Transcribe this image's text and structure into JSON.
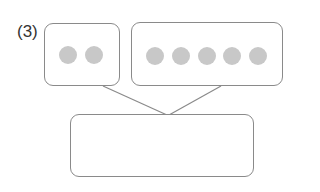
{
  "problem": {
    "label": "(3)"
  },
  "diagram": {
    "left_box": {
      "dot_count": 2,
      "dot_color": "#c8c8c8"
    },
    "right_box": {
      "dot_count": 5,
      "dot_color": "#c8c8c8"
    },
    "answer_box": {
      "value": ""
    },
    "line_color": "#8a8a8a",
    "border_color": "#8a8a8a"
  }
}
